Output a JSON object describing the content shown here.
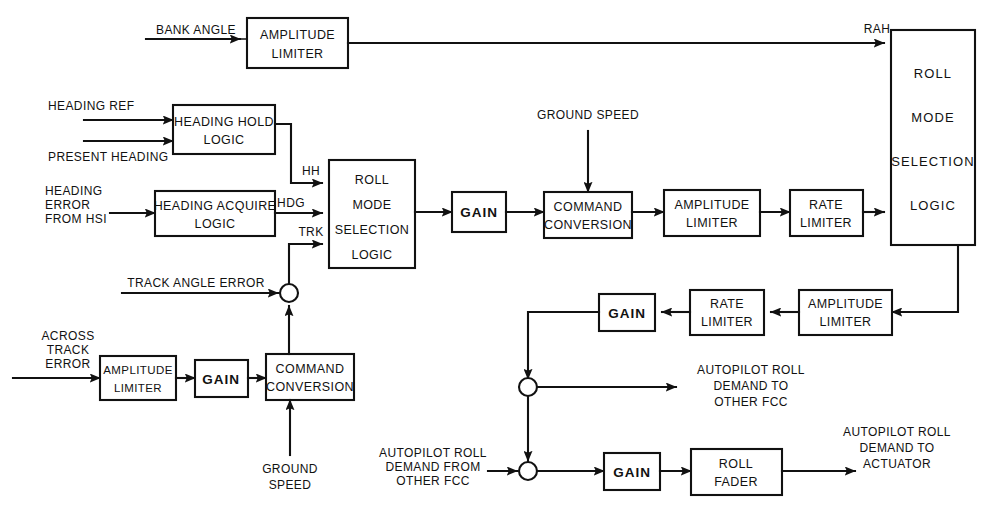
{
  "diagram": {
    "stroke_color": "#111111",
    "background_color": "#ffffff"
  },
  "blocks": {
    "amplitude_limiter_top": {
      "line1": "AMPLITUDE",
      "line2": "LIMITER"
    },
    "heading_hold_logic": {
      "line1": "HEADING HOLD",
      "line2": "LOGIC"
    },
    "heading_acquire_logic": {
      "line1": "HEADING ACQUIRE",
      "line2": "LOGIC"
    },
    "roll_mode_selection_logic_mid": {
      "line1": "ROLL",
      "line2": "MODE",
      "line3": "SELECTION",
      "line4": "LOGIC"
    },
    "gain_mid": {
      "label": "GAIN"
    },
    "command_conversion_mid": {
      "line1": "COMMAND",
      "line2": "CONVERSION"
    },
    "amplitude_limiter_fwd": {
      "line1": "AMPLITUDE",
      "line2": "LIMITER"
    },
    "rate_limiter_fwd": {
      "line1": "RATE",
      "line2": "LIMITER"
    },
    "roll_mode_selection_logic_right": {
      "line1": "ROLL",
      "line2": "MODE",
      "line3": "SELECTION",
      "line4": "LOGIC"
    },
    "amplitude_limiter_fb": {
      "line1": "AMPLITUDE",
      "line2": "LIMITER"
    },
    "rate_limiter_fb": {
      "line1": "RATE",
      "line2": "LIMITER"
    },
    "gain_fb": {
      "label": "GAIN"
    },
    "amplitude_limiter_track": {
      "line1": "AMPLITUDE",
      "line2": "LIMITER"
    },
    "gain_track": {
      "label": "GAIN"
    },
    "command_conversion_track": {
      "line1": "COMMAND",
      "line2": "CONVERSION"
    },
    "gain_out": {
      "label": "GAIN"
    },
    "roll_fader": {
      "line1": "ROLL",
      "line2": "FADER"
    }
  },
  "signals": {
    "bank_angle": "BANK ANGLE",
    "rah": "RAH",
    "heading_ref": "HEADING REF",
    "present_heading": "PRESENT HEADING",
    "heading_error_from_hsi": {
      "line1": "HEADING",
      "line2": "ERROR",
      "line3": "FROM HSI"
    },
    "hh": "HH",
    "hdg": "HDG",
    "trk": "TRK",
    "ground_speed_top": "GROUND SPEED",
    "ground_speed_bottom": {
      "line1": "GROUND",
      "line2": "SPEED"
    },
    "track_angle_error": "TRACK ANGLE ERROR",
    "across_track_error": {
      "line1": "ACROSS",
      "line2": "TRACK",
      "line3": "ERROR"
    },
    "autopilot_roll_demand_to_other_fcc": {
      "line1": "AUTOPILOT ROLL",
      "line2": "DEMAND TO",
      "line3": "OTHER FCC"
    },
    "autopilot_roll_demand_from_other_fcc": {
      "line1": "AUTOPILOT ROLL",
      "line2": "DEMAND FROM",
      "line3": "OTHER FCC"
    },
    "autopilot_roll_demand_to_actuator": {
      "line1": "AUTOPILOT ROLL",
      "line2": "DEMAND TO",
      "line3": "ACTUATOR"
    }
  }
}
